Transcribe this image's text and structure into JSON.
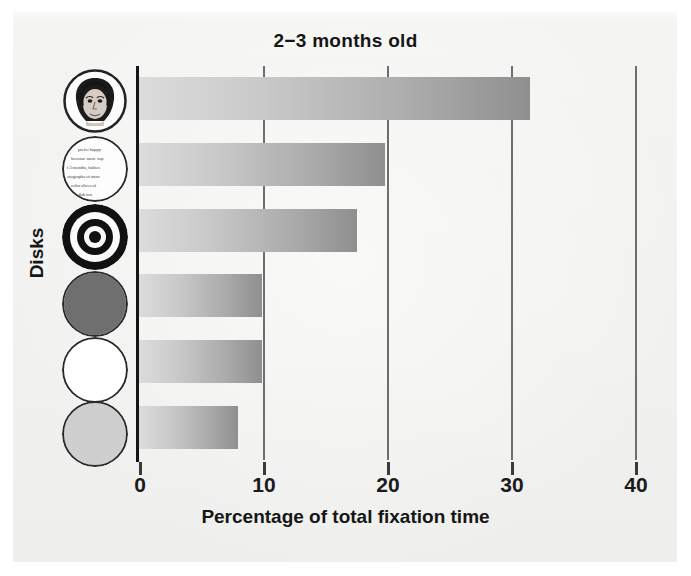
{
  "chart_data": {
    "type": "bar",
    "orientation": "horizontal",
    "title": "2−3 months old",
    "xlabel": "Percentage of total fixation time",
    "ylabel": "Disks",
    "xlim": [
      0,
      40
    ],
    "xticks": [
      0,
      10,
      20,
      30,
      40
    ],
    "xtick_labels": [
      "0",
      "10",
      "20",
      "30",
      "40"
    ],
    "grid": true,
    "grid_axis": "x",
    "legend": false,
    "categories": [
      "face disk",
      "newsprint disk",
      "bullseye disk",
      "red disk",
      "white disk",
      "yellow disk"
    ],
    "values": [
      31.5,
      19.8,
      17.6,
      9.9,
      9.9,
      8.0
    ],
    "bar_gradient": {
      "from": "#dcdcdc",
      "to": "#8f8f8f"
    }
  },
  "figure": {
    "background_color": "#f2f2f0",
    "title": "2−3 months old",
    "x_axis_title": "Percentage of total fixation time",
    "y_axis_title": "Disks"
  },
  "axis": {
    "tick_labels": [
      "0",
      "10",
      "20",
      "30",
      "40"
    ]
  },
  "disks": [
    {
      "name": "face-disk",
      "description": "photograph of a human face",
      "fill": "#fbfbfb",
      "outline": "#2a2a2a"
    },
    {
      "name": "newsprint-disk",
      "description": "disk printed with newsprint text",
      "fill": "#fdfdfd",
      "outline": "#2a2a2a",
      "text_lines": [
        "prefer happy",
        "become more sop",
        "t 3 months, babies",
        "otographs of stran",
        "color slices of",
        "dult not"
      ]
    },
    {
      "name": "bullseye-disk",
      "description": "black and white concentric rings",
      "fill": "#111111",
      "outline": "#111111"
    },
    {
      "name": "red-disk",
      "description": "solid dark red disk",
      "fill": "#6f6f6f",
      "outline": "#2a2a2a"
    },
    {
      "name": "white-disk",
      "description": "solid white disk",
      "fill": "#ffffff",
      "outline": "#2a2a2a"
    },
    {
      "name": "yellow-disk",
      "description": "solid light yellow disk",
      "fill": "#cfcfcf",
      "outline": "#2a2a2a"
    }
  ]
}
